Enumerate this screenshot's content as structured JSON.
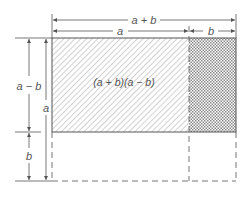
{
  "diagram": {
    "labels": {
      "top_total": "a + b",
      "top_a": "a",
      "top_b": "b",
      "left_a_minus_b": "a − b",
      "left_a": "a",
      "left_b": "b",
      "area": "(a + b)(a − b)"
    },
    "regions": [
      {
        "name": "main-region",
        "fill": "diagonal-hatch",
        "width": "a",
        "height": "a − b"
      },
      {
        "name": "side-region",
        "fill": "crosshatch",
        "width": "b",
        "height": "a − b"
      },
      {
        "name": "removed-region",
        "fill": "none (dashed outline)",
        "width": "a + b",
        "height": "b"
      }
    ],
    "colors": {
      "line": "#555555",
      "hatch": "#9a9a9a",
      "background": "#ffffff"
    }
  }
}
